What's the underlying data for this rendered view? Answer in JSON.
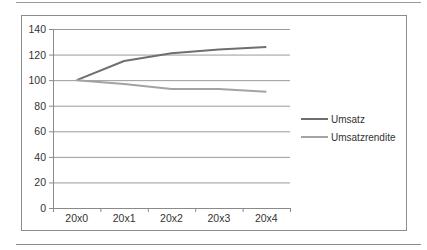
{
  "chart_data": {
    "type": "line",
    "title": "",
    "xlabel": "",
    "ylabel": "",
    "categories": [
      "20x0",
      "20x1",
      "20x2",
      "20x3",
      "20x4"
    ],
    "series": [
      {
        "name": "Umsatz",
        "values": [
          100,
          115,
          121,
          124,
          126
        ],
        "color": "#6f6f6f"
      },
      {
        "name": "Umsatzrendite",
        "values": [
          100,
          97,
          93,
          93,
          91
        ],
        "color": "#a3a3a3"
      }
    ],
    "ylim": [
      0,
      140
    ],
    "yticks": [
      0,
      20,
      40,
      60,
      80,
      100,
      120,
      140
    ],
    "grid": true,
    "legend_position": "right"
  },
  "legend": {
    "items": [
      {
        "label": "Umsatz"
      },
      {
        "label": "Umsatzrendite"
      }
    ]
  },
  "axis": {
    "y_labels": [
      "140",
      "120",
      "100",
      "80",
      "60",
      "40",
      "20",
      "0"
    ],
    "x_labels": [
      "20x0",
      "20x1",
      "20x2",
      "20x3",
      "20x4"
    ]
  }
}
